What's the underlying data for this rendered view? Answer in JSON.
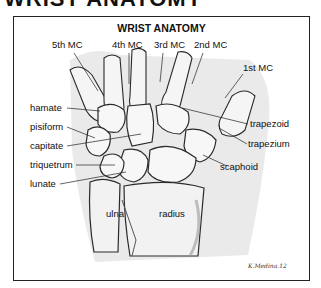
{
  "heading_partial": "WRIST ANATOMY",
  "figure": {
    "title": "WRIST ANATOMY",
    "metacarpals": [
      "5th MC",
      "4th MC",
      "3rd MC",
      "2nd MC",
      "1st MC"
    ],
    "carpal_labels_left": [
      "hamate",
      "pisiform",
      "capitate",
      "triquetrum",
      "lunate"
    ],
    "carpal_labels_right": [
      "trapezoid",
      "trapezium",
      "scaphoid"
    ],
    "forearm": [
      "ulna",
      "radius"
    ],
    "signature": "K.Medina.12"
  },
  "colors": {
    "border": "#222222",
    "bone_fill": "#f6f6f6",
    "bone_outline": "#2a2a2a",
    "shade": "#9a9a9a",
    "background": "#ffffff"
  }
}
